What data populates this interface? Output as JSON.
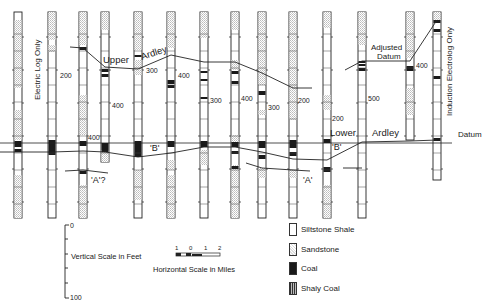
{
  "diagram": {
    "type": "geologic-cross-section",
    "labels": {
      "upper": "Upper",
      "ardley_upper": "Ardley",
      "lower": "Lower",
      "ardley_lower": "Ardley",
      "datum": "Datum",
      "adjusted_datum_line1": "Adjusted",
      "adjusted_datum_line2": "Datum",
      "electric_log_only": "Electric Log Only",
      "induction_electrolog_only": "Induction Electrolog Only",
      "marker_b_1": "'B'",
      "marker_b_2": "'B'",
      "marker_a_q": "'A'?",
      "marker_a": "'A'"
    },
    "depth_labels": [
      {
        "x": 60,
        "y": 78,
        "text": "200"
      },
      {
        "x": 88,
        "y": 140,
        "text": "400"
      },
      {
        "x": 112,
        "y": 108,
        "text": "400"
      },
      {
        "x": 146,
        "y": 73,
        "text": "300"
      },
      {
        "x": 178,
        "y": 78,
        "text": "400"
      },
      {
        "x": 210,
        "y": 103,
        "text": "300"
      },
      {
        "x": 241,
        "y": 101,
        "text": "400"
      },
      {
        "x": 268,
        "y": 110,
        "text": "300"
      },
      {
        "x": 298,
        "y": 103,
        "text": "200"
      },
      {
        "x": 332,
        "y": 121,
        "text": "200"
      },
      {
        "x": 368,
        "y": 101,
        "text": "500"
      },
      {
        "x": 416,
        "y": 68,
        "text": "400"
      }
    ],
    "columns": [
      {
        "x": 18,
        "top": 12,
        "bottom": 218
      },
      {
        "x": 52,
        "top": 12,
        "bottom": 218
      },
      {
        "x": 83,
        "top": 12,
        "bottom": 218
      },
      {
        "x": 105,
        "top": 12,
        "bottom": 162
      },
      {
        "x": 138,
        "top": 12,
        "bottom": 218
      },
      {
        "x": 171,
        "top": 12,
        "bottom": 218
      },
      {
        "x": 204,
        "top": 12,
        "bottom": 218
      },
      {
        "x": 235,
        "top": 12,
        "bottom": 218
      },
      {
        "x": 262,
        "top": 12,
        "bottom": 218
      },
      {
        "x": 293,
        "top": 12,
        "bottom": 218
      },
      {
        "x": 327,
        "top": 12,
        "bottom": 218
      },
      {
        "x": 362,
        "top": 12,
        "bottom": 218
      },
      {
        "x": 410,
        "top": 12,
        "bottom": 140
      },
      {
        "x": 437,
        "top": 12,
        "bottom": 180
      }
    ]
  },
  "scales": {
    "vertical": {
      "title": "Vertical Scale in Feet",
      "top": "0",
      "bottom": "100"
    },
    "horizontal": {
      "title": "Horizontal Scale in Miles",
      "ticks": [
        "1",
        "0",
        "1",
        "2"
      ]
    }
  },
  "legend": {
    "items": [
      {
        "key": "siltstone",
        "label": "Siltstone Shale"
      },
      {
        "key": "sandstone",
        "label": "Sandstone"
      },
      {
        "key": "coal",
        "label": "Coal"
      },
      {
        "key": "shaly-coal",
        "label": "Shaly Coal"
      }
    ]
  },
  "colors": {
    "ink": "#1a1a1a",
    "sand": "#d8d8d8",
    "paper": "#ffffff"
  }
}
